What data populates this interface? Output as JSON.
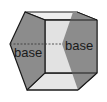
{
  "diagram": {
    "type": "pentagonal-prism",
    "labels": {
      "left_base": "base",
      "right_base": "base"
    },
    "colors": {
      "base_fill": "#8c8c8c",
      "lateral_fill": "#e2e2e2",
      "top_fill": "#efefef",
      "edge": "#1a1a1a",
      "hidden_edge": "#333333"
    }
  }
}
